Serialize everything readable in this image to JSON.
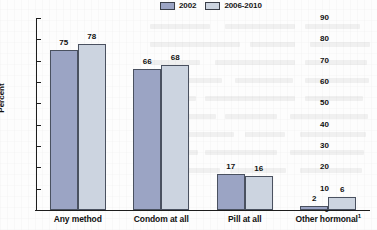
{
  "chart_data": {
    "type": "bar",
    "title": "",
    "subtitle": "",
    "xlabel": "",
    "ylabel": "Percent",
    "ylim": [
      0,
      90
    ],
    "ytick_step": 10,
    "yticks": [
      90,
      80,
      70,
      60,
      50,
      40,
      30,
      20,
      10,
      0
    ],
    "grid": false,
    "legend_position": "top-center",
    "categories": [
      "Any method",
      "Condom at all",
      "Pill at all",
      "Other hormonal"
    ],
    "category_footnotes": [
      "",
      "",
      "",
      "1"
    ],
    "series": [
      {
        "name": "2002",
        "color": "#9ba4c4",
        "values": [
          75,
          66,
          17,
          2
        ]
      },
      {
        "name": "2006-2010",
        "color": "#ccd4e0",
        "values": [
          78,
          68,
          16,
          6
        ]
      }
    ]
  },
  "legend": {
    "items": [
      {
        "label": "2002",
        "swatch": "#9ba4c4"
      },
      {
        "label": "2006-2010",
        "swatch": "#ccd4e0"
      }
    ]
  },
  "axes": {
    "y": {
      "label": "Percent",
      "ticks": [
        "90",
        "80",
        "70",
        "60",
        "50",
        "40",
        "30",
        "20",
        "10",
        "0"
      ]
    },
    "x": {
      "ticks": [
        "Any method",
        "Condom at all",
        "Pill at all",
        "Other hormonal"
      ]
    }
  },
  "colors": {
    "series_2002": "#9ba4c4",
    "series_2006_2010": "#ccd4e0",
    "bar_border": "#4a5160",
    "axis": "#1d1d1d",
    "text": "#111111",
    "background": "#fdfdfd"
  }
}
